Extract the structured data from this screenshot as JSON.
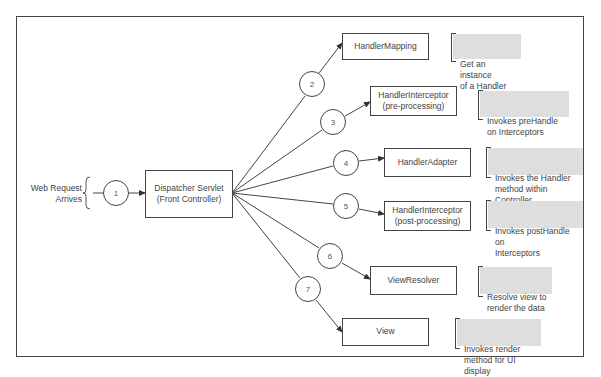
{
  "diagram": {
    "input": {
      "label": "Web Request\nArrives"
    },
    "front_controller": {
      "label": "Dispatcher Servlet\n(Front Controller)"
    },
    "steps": [
      {
        "number": "1",
        "target": "Dispatcher Servlet (Front Controller)",
        "note": ""
      },
      {
        "number": "2",
        "component": "HandlerMapping",
        "note": "Get an instance\nof a Handler"
      },
      {
        "number": "3",
        "component": "HandlerInterceptor\n(pre-processing)",
        "note": "Invokes preHandle\non Interceptors"
      },
      {
        "number": "4",
        "component": "HandlerAdapter",
        "note": "Invokes the Handler\nmethod within Controller"
      },
      {
        "number": "5",
        "component": "HandlerInterceptor\n(post-processing)",
        "note": "Invokes postHandle on\nInterceptors"
      },
      {
        "number": "6",
        "component": "ViewResolver",
        "note": "Resolve view to\nrender the data"
      },
      {
        "number": "7",
        "component": "View",
        "note": "Invokes render\nmethod for UI display"
      }
    ],
    "colors": {
      "stroke": "#444444",
      "note_fill": "#dedede",
      "text": "#444444",
      "background": "#ffffff"
    }
  }
}
